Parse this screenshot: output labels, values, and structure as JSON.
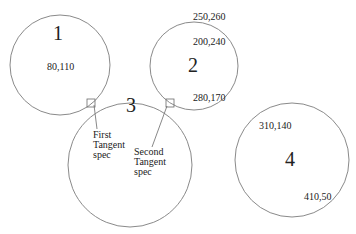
{
  "diagram": {
    "circles": [
      {
        "label": "1",
        "cx": 60,
        "cy": 65,
        "r": 50,
        "points": [
          "80,110"
        ]
      },
      {
        "label": "2",
        "cx": 194,
        "cy": 66,
        "r": 44,
        "points": [
          "250,260",
          "200,240",
          "280,170"
        ]
      },
      {
        "label": "3",
        "cx": 130,
        "cy": 165,
        "r": 62,
        "points": []
      },
      {
        "label": "4",
        "cx": 292,
        "cy": 160,
        "r": 57,
        "points": [
          "310,140",
          "410,50"
        ]
      }
    ],
    "annotations": {
      "first_tangent": [
        "First",
        "Tangent",
        "spec"
      ],
      "second_tangent": [
        "Second",
        "Tangent",
        "spec"
      ]
    }
  }
}
